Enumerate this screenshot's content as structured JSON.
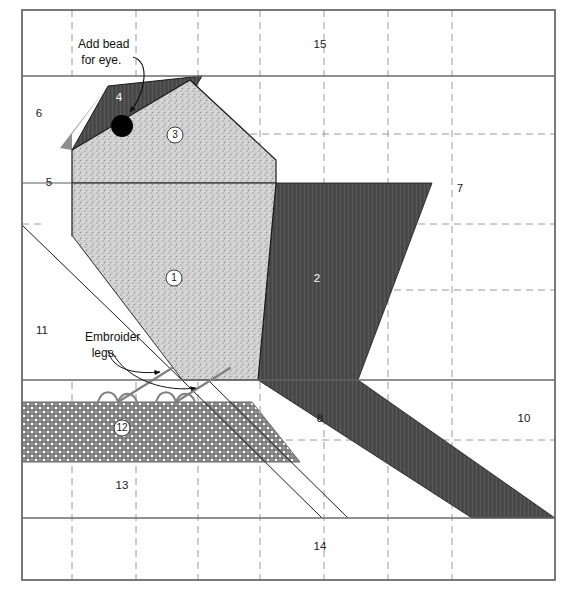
{
  "canvas": {
    "width": 572,
    "height": 590
  },
  "border": {
    "x": 22,
    "y": 10,
    "width": 533,
    "height": 570,
    "color": "#6b6b6b"
  },
  "colors": {
    "dark": "#4a4a4a",
    "mid_gray": "#8f8f8f",
    "light_speckle": "#cfcfcf",
    "crosshatch": "#8a8a8a",
    "outline": "#1a1a1a",
    "grid_dashed": "#9a9a9a",
    "grid_solid": "#6b6b6b",
    "white": "#ffffff",
    "bead": "#000000",
    "leg_line": "#7d7d7d"
  },
  "grid": {
    "vertical_dashed_x": [
      72,
      136,
      198,
      260,
      324,
      388,
      452
    ],
    "horizontal_dashed_y": [
      134,
      224,
      290,
      440
    ],
    "horizontal_solid_y": [
      76,
      380,
      518
    ]
  },
  "notes": [
    {
      "name": "add-bead-note",
      "text": "Add bead\n for eye.",
      "x": 78,
      "y": 36
    },
    {
      "name": "embroider-legs-note",
      "text": "Embroider\n  legs.",
      "x": 85,
      "y": 329
    }
  ],
  "pieces": [
    {
      "id": 1,
      "label": "1",
      "style": "circle",
      "fill": "light_speckle",
      "x": 174,
      "y": 278
    },
    {
      "id": 2,
      "label": "2",
      "style": "plain_light",
      "fill": "dark",
      "x": 317,
      "y": 278
    },
    {
      "id": 3,
      "label": "3",
      "style": "circle",
      "fill": "light_speckle",
      "x": 175,
      "y": 135
    },
    {
      "id": 4,
      "label": "4",
      "style": "plain_light",
      "fill": "dark",
      "x": 119,
      "y": 97
    },
    {
      "id": 5,
      "label": "5",
      "style": "plain",
      "fill": "white",
      "x": 49,
      "y": 182
    },
    {
      "id": 6,
      "label": "6",
      "style": "plain",
      "fill": "white",
      "x": 39,
      "y": 113
    },
    {
      "id": 7,
      "label": "7",
      "style": "plain",
      "fill": "white",
      "x": 460,
      "y": 188
    },
    {
      "id": 8,
      "label": "8",
      "style": "plain",
      "fill": "white",
      "x": 320,
      "y": 418
    },
    {
      "id": 9,
      "label": "9",
      "style": "plain_light",
      "fill": "dark",
      "x": 448,
      "y": 418
    },
    {
      "id": 10,
      "label": "10",
      "style": "plain",
      "fill": "white",
      "x": 524,
      "y": 418
    },
    {
      "id": 11,
      "label": "11",
      "style": "plain",
      "fill": "white",
      "x": 42,
      "y": 330
    },
    {
      "id": 12,
      "label": "12",
      "style": "circle",
      "fill": "crosshatch",
      "x": 122,
      "y": 428
    },
    {
      "id": 13,
      "label": "13",
      "style": "plain",
      "fill": "white",
      "x": 122,
      "y": 485
    },
    {
      "id": 14,
      "label": "14",
      "style": "plain",
      "fill": "white",
      "x": 320,
      "y": 546
    },
    {
      "id": 15,
      "label": "15",
      "style": "plain",
      "fill": "white",
      "x": 320,
      "y": 44
    }
  ],
  "shapes": {
    "bead": {
      "cx": 122,
      "cy": 126,
      "r": 11
    },
    "beak_apex": {
      "x": 11,
      "y": 180
    }
  }
}
